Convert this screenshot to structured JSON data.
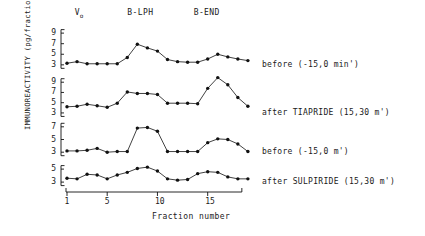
{
  "figure": {
    "y_axis_title": "IMMUNOREACTIVITY (pg/fraction)",
    "x_axis_title": "Fraction number",
    "x_ticks": [
      "1",
      "5",
      "10",
      "15"
    ],
    "x_tick_values": [
      1,
      5,
      10,
      15
    ],
    "peak_markers": [
      {
        "name": "void-volume-marker",
        "label": "V",
        "sub": "o",
        "fraction": 2.0
      },
      {
        "name": "beta-lph-marker",
        "label": "B-LPH",
        "sub": "",
        "fraction": 8.2
      },
      {
        "name": "beta-end-marker",
        "label": "B-END",
        "sub": "",
        "fraction": 14.8
      }
    ]
  },
  "chart_data": {
    "type": "line",
    "title": "",
    "xlabel": "Fraction number",
    "ylabel": "IMMUNOREACTIVITY (pg/fraction)",
    "x": [
      1,
      2,
      3,
      4,
      5,
      6,
      7,
      8,
      9,
      10,
      11,
      12,
      13,
      14,
      15,
      16,
      17,
      18
    ],
    "xlim": [
      1,
      18
    ],
    "grid": false,
    "legend_position": "right-of-panels",
    "annotations": [
      "V₀",
      "B-LPH",
      "B-END"
    ],
    "panels": [
      {
        "name": "panel-before-15-0-min",
        "label": "before (-15,0 min')",
        "y_ticks": [
          3,
          5,
          7,
          9
        ],
        "ylim": [
          2.4,
          9.4
        ],
        "values": [
          3.3,
          3.6,
          3.2,
          3.2,
          3.2,
          3.2,
          4.4,
          6.9,
          6.2,
          5.6,
          4.0,
          3.6,
          3.5,
          3.5,
          4.1,
          5.0,
          4.5,
          4.1,
          3.8
        ]
      },
      {
        "name": "panel-after-tiapride",
        "label": "after TIAPRIDE (15,30 m')",
        "y_ticks": [
          3,
          5,
          7,
          9
        ],
        "ylim": [
          2.4,
          10.8
        ],
        "values": [
          4.2,
          4.3,
          4.7,
          4.4,
          4.1,
          4.9,
          7.1,
          6.8,
          6.8,
          6.6,
          4.9,
          4.9,
          4.9,
          4.8,
          7.8,
          9.9,
          8.5,
          6.0,
          4.3
        ]
      },
      {
        "name": "panel-before-15-0-m",
        "label": "before (-15,0 m')",
        "y_ticks": [
          3,
          5,
          7
        ],
        "ylim": [
          2.4,
          7.6
        ],
        "values": [
          3.2,
          3.2,
          3.3,
          3.6,
          3.0,
          3.1,
          3.1,
          6.8,
          6.9,
          6.3,
          3.1,
          3.1,
          3.1,
          3.1,
          4.5,
          5.1,
          5.0,
          4.3,
          3.1
        ]
      },
      {
        "name": "panel-after-sulpiride",
        "label": "after SULPIRIDE (15,30 m')",
        "y_ticks": [
          3,
          5
        ],
        "ylim": [
          2.4,
          6.4
        ],
        "values": [
          3.6,
          3.5,
          4.2,
          4.1,
          3.5,
          4.1,
          4.5,
          5.1,
          5.3,
          4.7,
          3.5,
          3.3,
          3.4,
          4.3,
          4.6,
          4.5,
          3.8,
          3.5,
          3.5
        ]
      }
    ]
  }
}
